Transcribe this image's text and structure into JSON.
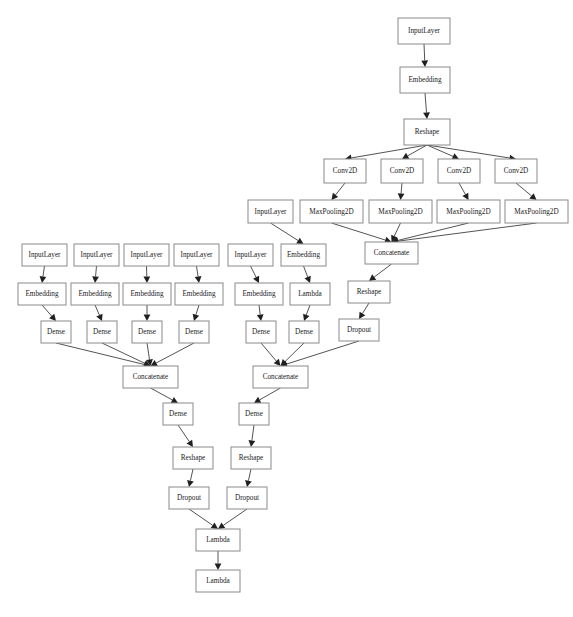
{
  "diagram": {
    "type": "directed-graph",
    "canvas": {
      "width": 573,
      "height": 617,
      "background": "#ffffff"
    },
    "style": {
      "node_fill": "#ffffff",
      "node_stroke": "#8a8a8a",
      "edge_color": "#404040",
      "label_color": "#1a1a1a",
      "font_size": 7.2
    },
    "nodes": [
      {
        "id": "n1",
        "label": "InputLayer",
        "x": 398,
        "y": 18,
        "w": 52,
        "h": 26
      },
      {
        "id": "n2",
        "label": "Embedding",
        "x": 400,
        "y": 67,
        "w": 50,
        "h": 26
      },
      {
        "id": "n3",
        "label": "Reshape",
        "x": 404,
        "y": 119,
        "w": 46,
        "h": 26
      },
      {
        "id": "c1",
        "label": "Conv2D",
        "x": 324,
        "y": 159,
        "w": 42,
        "h": 24
      },
      {
        "id": "c2",
        "label": "Conv2D",
        "x": 381,
        "y": 159,
        "w": 42,
        "h": 24
      },
      {
        "id": "c3",
        "label": "Conv2D",
        "x": 438,
        "y": 159,
        "w": 42,
        "h": 24
      },
      {
        "id": "c4",
        "label": "Conv2D",
        "x": 495,
        "y": 159,
        "w": 42,
        "h": 24
      },
      {
        "id": "ilc",
        "label": "InputLayer",
        "x": 248,
        "y": 200,
        "w": 45,
        "h": 23
      },
      {
        "id": "m1",
        "label": "MaxPooling2D",
        "x": 300,
        "y": 200,
        "w": 63,
        "h": 23
      },
      {
        "id": "m2",
        "label": "MaxPooling2D",
        "x": 369,
        "y": 200,
        "w": 63,
        "h": 23
      },
      {
        "id": "m3",
        "label": "MaxPooling2D",
        "x": 437,
        "y": 200,
        "w": 63,
        "h": 23
      },
      {
        "id": "m4",
        "label": "MaxPooling2D",
        "x": 505,
        "y": 200,
        "w": 63,
        "h": 23
      },
      {
        "id": "i1",
        "label": "InputLayer",
        "x": 22,
        "y": 244,
        "w": 45,
        "h": 22
      },
      {
        "id": "i2",
        "label": "InputLayer",
        "x": 74,
        "y": 244,
        "w": 45,
        "h": 22
      },
      {
        "id": "i3",
        "label": "InputLayer",
        "x": 124,
        "y": 244,
        "w": 45,
        "h": 22
      },
      {
        "id": "i4",
        "label": "InputLayer",
        "x": 174,
        "y": 244,
        "w": 45,
        "h": 22
      },
      {
        "id": "i5",
        "label": "InputLayer",
        "x": 228,
        "y": 244,
        "w": 45,
        "h": 22
      },
      {
        "id": "em6",
        "label": "Embedding",
        "x": 281,
        "y": 244,
        "w": 45,
        "h": 22
      },
      {
        "id": "cc1",
        "label": "Concatenate",
        "x": 365,
        "y": 242,
        "w": 53,
        "h": 22
      },
      {
        "id": "e1",
        "label": "Embedding",
        "x": 18,
        "y": 283,
        "w": 48,
        "h": 22
      },
      {
        "id": "e2",
        "label": "Embedding",
        "x": 71,
        "y": 283,
        "w": 48,
        "h": 22
      },
      {
        "id": "e3",
        "label": "Embedding",
        "x": 123,
        "y": 283,
        "w": 48,
        "h": 22
      },
      {
        "id": "e4",
        "label": "Embedding",
        "x": 175,
        "y": 283,
        "w": 48,
        "h": 22
      },
      {
        "id": "e5",
        "label": "Embedding",
        "x": 235,
        "y": 283,
        "w": 48,
        "h": 22
      },
      {
        "id": "lam",
        "label": "Lambda",
        "x": 290,
        "y": 283,
        "w": 40,
        "h": 22
      },
      {
        "id": "rs1",
        "label": "Reshape",
        "x": 348,
        "y": 281,
        "w": 42,
        "h": 22
      },
      {
        "id": "d1",
        "label": "Dense",
        "x": 41,
        "y": 321,
        "w": 30,
        "h": 22
      },
      {
        "id": "d2",
        "label": "Dense",
        "x": 87,
        "y": 321,
        "w": 30,
        "h": 22
      },
      {
        "id": "d3",
        "label": "Dense",
        "x": 132,
        "y": 321,
        "w": 30,
        "h": 22
      },
      {
        "id": "d4",
        "label": "Dense",
        "x": 179,
        "y": 321,
        "w": 30,
        "h": 22
      },
      {
        "id": "d5",
        "label": "Dense",
        "x": 246,
        "y": 321,
        "w": 30,
        "h": 22
      },
      {
        "id": "d6",
        "label": "Dense",
        "x": 289,
        "y": 321,
        "w": 30,
        "h": 22
      },
      {
        "id": "dr1",
        "label": "Dropout",
        "x": 339,
        "y": 319,
        "w": 40,
        "h": 22
      },
      {
        "id": "cc2",
        "label": "Concatenate",
        "x": 123,
        "y": 366,
        "w": 55,
        "h": 22
      },
      {
        "id": "cc3",
        "label": "Concatenate",
        "x": 253,
        "y": 366,
        "w": 55,
        "h": 22
      },
      {
        "id": "d7",
        "label": "Dense",
        "x": 163,
        "y": 403,
        "w": 30,
        "h": 22
      },
      {
        "id": "d8",
        "label": "Dense",
        "x": 239,
        "y": 403,
        "w": 30,
        "h": 22
      },
      {
        "id": "rs2",
        "label": "Reshape",
        "x": 173,
        "y": 447,
        "w": 40,
        "h": 22
      },
      {
        "id": "rs3",
        "label": "Reshape",
        "x": 231,
        "y": 447,
        "w": 40,
        "h": 22
      },
      {
        "id": "dr2",
        "label": "Dropout",
        "x": 169,
        "y": 487,
        "w": 40,
        "h": 22
      },
      {
        "id": "dr3",
        "label": "Dropout",
        "x": 227,
        "y": 487,
        "w": 40,
        "h": 22
      },
      {
        "id": "lb1",
        "label": "Lambda",
        "x": 196,
        "y": 529,
        "w": 44,
        "h": 22
      },
      {
        "id": "lb2",
        "label": "Lambda",
        "x": 196,
        "y": 570,
        "w": 44,
        "h": 22
      }
    ],
    "edges": [
      {
        "from": "n1",
        "to": "n2"
      },
      {
        "from": "n2",
        "to": "n3"
      },
      {
        "from": "n3",
        "to": "c1"
      },
      {
        "from": "n3",
        "to": "c2"
      },
      {
        "from": "n3",
        "to": "c3"
      },
      {
        "from": "n3",
        "to": "c4"
      },
      {
        "from": "c1",
        "to": "m1"
      },
      {
        "from": "c2",
        "to": "m2"
      },
      {
        "from": "c3",
        "to": "m3"
      },
      {
        "from": "c4",
        "to": "m4"
      },
      {
        "from": "ilc",
        "to": "em6"
      },
      {
        "from": "m1",
        "to": "cc1"
      },
      {
        "from": "m2",
        "to": "cc1"
      },
      {
        "from": "m3",
        "to": "cc1"
      },
      {
        "from": "m4",
        "to": "cc1"
      },
      {
        "from": "cc1",
        "to": "rs1"
      },
      {
        "from": "rs1",
        "to": "dr1"
      },
      {
        "from": "i1",
        "to": "e1"
      },
      {
        "from": "i2",
        "to": "e2"
      },
      {
        "from": "i3",
        "to": "e3"
      },
      {
        "from": "i4",
        "to": "e4"
      },
      {
        "from": "i5",
        "to": "e5"
      },
      {
        "from": "em6",
        "to": "lam"
      },
      {
        "from": "e1",
        "to": "d1"
      },
      {
        "from": "e2",
        "to": "d2"
      },
      {
        "from": "e3",
        "to": "d3"
      },
      {
        "from": "e4",
        "to": "d4"
      },
      {
        "from": "e5",
        "to": "d5"
      },
      {
        "from": "lam",
        "to": "d6"
      },
      {
        "from": "d1",
        "to": "cc2"
      },
      {
        "from": "d2",
        "to": "cc2"
      },
      {
        "from": "d3",
        "to": "cc2"
      },
      {
        "from": "d4",
        "to": "cc2"
      },
      {
        "from": "d5",
        "to": "cc3"
      },
      {
        "from": "d6",
        "to": "cc3"
      },
      {
        "from": "dr1",
        "to": "cc3"
      },
      {
        "from": "cc2",
        "to": "d7"
      },
      {
        "from": "cc3",
        "to": "d8"
      },
      {
        "from": "d7",
        "to": "rs2"
      },
      {
        "from": "d8",
        "to": "rs3"
      },
      {
        "from": "rs2",
        "to": "dr2"
      },
      {
        "from": "rs3",
        "to": "dr3"
      },
      {
        "from": "dr2",
        "to": "lb1"
      },
      {
        "from": "dr3",
        "to": "lb1"
      },
      {
        "from": "lb1",
        "to": "lb2"
      }
    ]
  }
}
